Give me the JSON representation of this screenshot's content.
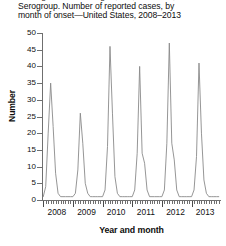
{
  "figure": {
    "title_lines": [
      "Meningococcal Meningitis, Hib, Neisseria, Californa",
      "Serogroup. Number of reported cases, by",
      "month of onset—United States, 2008–2013"
    ],
    "line_color": "#8a8a8a",
    "axis_color": "#6f6f6f",
    "background": "#ffffff"
  },
  "chart_data": {
    "type": "line",
    "title": "Serogroup. Number of reported cases, by month of onset—United States, 2008–2013",
    "xlabel": "Year and month",
    "ylabel": "Number",
    "ylim": [
      0,
      50
    ],
    "ytick_labels": [
      "0",
      "5",
      "10",
      "15",
      "20",
      "25",
      "30",
      "35",
      "40",
      "45",
      "50"
    ],
    "ytick_values": [
      0,
      5,
      10,
      15,
      20,
      25,
      30,
      35,
      40,
      45,
      50
    ],
    "xtick_labels": [
      "2008",
      "2009",
      "2010",
      "2011",
      "2012",
      "2013"
    ],
    "xtick_values": [
      2008,
      2009,
      2010,
      2011,
      2012,
      2013
    ],
    "grid": false,
    "legend": "none",
    "x_minor_ticks": "monthly",
    "series": [
      {
        "name": "Reported cases by month of onset",
        "x": [
          "2008-01",
          "2008-02",
          "2008-03",
          "2008-04",
          "2008-05",
          "2008-06",
          "2008-07",
          "2008-08",
          "2008-09",
          "2008-10",
          "2008-11",
          "2008-12",
          "2009-01",
          "2009-02",
          "2009-03",
          "2009-04",
          "2009-05",
          "2009-06",
          "2009-07",
          "2009-08",
          "2009-09",
          "2009-10",
          "2009-11",
          "2009-12",
          "2010-01",
          "2010-02",
          "2010-03",
          "2010-04",
          "2010-05",
          "2010-06",
          "2010-07",
          "2010-08",
          "2010-09",
          "2010-10",
          "2010-11",
          "2010-12",
          "2011-01",
          "2011-02",
          "2011-03",
          "2011-04",
          "2011-05",
          "2011-06",
          "2011-07",
          "2011-08",
          "2011-09",
          "2011-10",
          "2011-11",
          "2011-12",
          "2012-01",
          "2012-02",
          "2012-03",
          "2012-04",
          "2012-05",
          "2012-06",
          "2012-07",
          "2012-08",
          "2012-09",
          "2012-10",
          "2012-11",
          "2012-12",
          "2013-01",
          "2013-02",
          "2013-03",
          "2013-04",
          "2013-05",
          "2013-06",
          "2013-07",
          "2013-08",
          "2013-09",
          "2013-10",
          "2013-11",
          "2013-12"
        ],
        "values": [
          1,
          4,
          20,
          35,
          22,
          8,
          2,
          1,
          1,
          1,
          1,
          1,
          1,
          2,
          9,
          26,
          17,
          5,
          2,
          1,
          1,
          1,
          1,
          1,
          1,
          3,
          16,
          46,
          26,
          7,
          2,
          1,
          1,
          1,
          1,
          1,
          1,
          3,
          14,
          40,
          14,
          11,
          3,
          1,
          1,
          1,
          1,
          1,
          1,
          3,
          17,
          47,
          17,
          12,
          3,
          1,
          1,
          1,
          1,
          1,
          1,
          3,
          13,
          41,
          20,
          6,
          2,
          1,
          1,
          1,
          1,
          1
        ],
        "peaks": [
          {
            "year": 2008,
            "value": 35
          },
          {
            "year": 2009,
            "value": 26
          },
          {
            "year": 2010,
            "value": 46
          },
          {
            "year": 2011,
            "value": 40
          },
          {
            "year": 2012,
            "value": 47
          },
          {
            "year": 2013,
            "value": 41
          }
        ]
      }
    ]
  }
}
